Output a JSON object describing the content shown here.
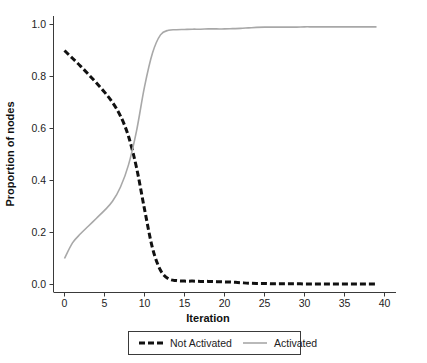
{
  "chart_data": {
    "type": "line",
    "title": "",
    "xlabel": "Iteration",
    "ylabel": "Proportion of nodes",
    "xlim": [
      -1,
      40
    ],
    "ylim": [
      -0.035,
      1.04
    ],
    "xticks": [
      0,
      5,
      10,
      15,
      20,
      25,
      30,
      35,
      40
    ],
    "xtick_labels": [
      "0",
      "5",
      "10",
      "15",
      "20",
      "25",
      "30",
      "35",
      "40"
    ],
    "yticks": [
      0.0,
      0.2,
      0.4,
      0.6,
      0.8,
      1.0
    ],
    "ytick_labels": [
      "0.0",
      "0.2",
      "0.4",
      "0.6",
      "0.8",
      "1.0"
    ],
    "grid": false,
    "legend_position": "below-center",
    "x": [
      0,
      1,
      2,
      3,
      4,
      5,
      6,
      7,
      8,
      9,
      10,
      11,
      12,
      13,
      14,
      15,
      16,
      17,
      18,
      19,
      20,
      21,
      22,
      23,
      24,
      25,
      26,
      27,
      28,
      29,
      30,
      31,
      32,
      33,
      34,
      35,
      36,
      37,
      38,
      39
    ],
    "series": [
      {
        "name": "Not Activated",
        "color": "#111111",
        "style": "dashed",
        "linewidth": 3,
        "dasharray": "6,3",
        "values": [
          0.9,
          0.87,
          0.84,
          0.808,
          0.775,
          0.74,
          0.7,
          0.648,
          0.57,
          0.45,
          0.29,
          0.14,
          0.055,
          0.022,
          0.015,
          0.013,
          0.013,
          0.012,
          0.012,
          0.011,
          0.01,
          0.009,
          0.007,
          0.005,
          0.004,
          0.004,
          0.003,
          0.003,
          0.003,
          0.003,
          0.002,
          0.002,
          0.002,
          0.002,
          0.002,
          0.002,
          0.002,
          0.002,
          0.002,
          0.002
        ]
      },
      {
        "name": "Activated",
        "color": "#a8a8a8",
        "style": "solid",
        "linewidth": 1.6,
        "dasharray": "",
        "values": [
          0.1,
          0.16,
          0.195,
          0.225,
          0.255,
          0.285,
          0.32,
          0.375,
          0.46,
          0.59,
          0.76,
          0.89,
          0.96,
          0.978,
          0.98,
          0.981,
          0.982,
          0.982,
          0.983,
          0.983,
          0.983,
          0.984,
          0.985,
          0.987,
          0.989,
          0.99,
          0.99,
          0.99,
          0.99,
          0.99,
          0.991,
          0.991,
          0.991,
          0.991,
          0.991,
          0.991,
          0.991,
          0.991,
          0.991,
          0.991
        ]
      }
    ]
  },
  "legend": {
    "entries": [
      {
        "label": "Not Activated",
        "swatch": "dashed-black-line"
      },
      {
        "label": "Activated",
        "swatch": "solid-gray-line"
      }
    ]
  },
  "axes": {
    "x_title": "Iteration",
    "y_title": "Proportion of nodes"
  }
}
